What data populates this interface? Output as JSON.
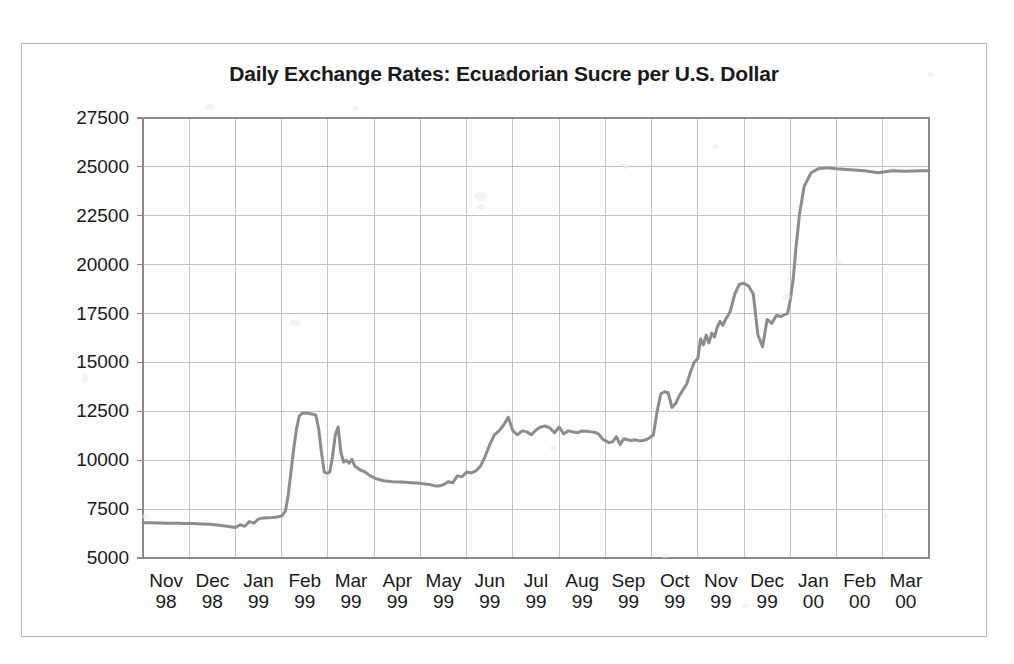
{
  "figure": {
    "title": "Daily Exchange Rates: Ecuadorian Sucre per U.S. Dollar",
    "background_color": "#fefefe",
    "frame_color": "#b9b9b9",
    "grid_color": "#c4c4c4",
    "axis_color": "#8a8a8a",
    "line_color": "#8d8d8d"
  },
  "chart_data": {
    "type": "line",
    "title": "Daily Exchange Rates: Ecuadorian Sucre per U.S. Dollar",
    "xlabel": "",
    "ylabel": "",
    "ylim": [
      5000,
      27500
    ],
    "ytick_values": [
      5000,
      7500,
      10000,
      12500,
      15000,
      17500,
      20000,
      22500,
      25000,
      27500
    ],
    "ytick_labels": [
      "5000",
      "7500",
      "10000",
      "12500",
      "15000",
      "17500",
      "20000",
      "22500",
      "25000",
      "27500"
    ],
    "xtick_labels": [
      {
        "month": "Nov",
        "year": "98"
      },
      {
        "month": "Dec",
        "year": "98"
      },
      {
        "month": "Jan",
        "year": "99"
      },
      {
        "month": "Feb",
        "year": "99"
      },
      {
        "month": "Mar",
        "year": "99"
      },
      {
        "month": "Apr",
        "year": "99"
      },
      {
        "month": "May",
        "year": "99"
      },
      {
        "month": "Jun",
        "year": "99"
      },
      {
        "month": "Jul",
        "year": "99"
      },
      {
        "month": "Aug",
        "year": "99"
      },
      {
        "month": "Sep",
        "year": "99"
      },
      {
        "month": "Oct",
        "year": "99"
      },
      {
        "month": "Nov",
        "year": "99"
      },
      {
        "month": "Dec",
        "year": "99"
      },
      {
        "month": "Jan",
        "year": "00"
      },
      {
        "month": "Feb",
        "year": "00"
      },
      {
        "month": "Mar",
        "year": "00"
      }
    ],
    "grid": true,
    "legend": null,
    "xlim": [
      0,
      17
    ],
    "x_unit": "months since Nov 1 1998",
    "series": [
      {
        "name": "Sucre per U.S. Dollar",
        "color": "#8d8d8d",
        "x": [
          0.0,
          0.18,
          0.36,
          0.55,
          0.73,
          0.91,
          1.09,
          1.27,
          1.45,
          1.64,
          1.82,
          2.0,
          2.1,
          2.2,
          2.3,
          2.4,
          2.5,
          2.6,
          2.7,
          2.8,
          2.9,
          3.0,
          3.08,
          3.14,
          3.2,
          3.26,
          3.32,
          3.38,
          3.44,
          3.5,
          3.56,
          3.62,
          3.68,
          3.74,
          3.8,
          3.86,
          3.92,
          3.98,
          4.04,
          4.1,
          4.16,
          4.22,
          4.28,
          4.34,
          4.4,
          4.46,
          4.52,
          4.58,
          4.64,
          4.7,
          4.8,
          4.92,
          5.05,
          5.2,
          5.4,
          5.6,
          5.8,
          6.0,
          6.1,
          6.2,
          6.3,
          6.4,
          6.5,
          6.6,
          6.7,
          6.8,
          6.9,
          7.0,
          7.1,
          7.2,
          7.3,
          7.4,
          7.5,
          7.6,
          7.7,
          7.8,
          7.9,
          8.0,
          8.1,
          8.2,
          8.3,
          8.4,
          8.5,
          8.6,
          8.7,
          8.8,
          8.9,
          9.0,
          9.1,
          9.2,
          9.3,
          9.4,
          9.5,
          9.6,
          9.7,
          9.8,
          9.85,
          9.9,
          9.95,
          10.0,
          10.08,
          10.16,
          10.24,
          10.32,
          10.4,
          10.48,
          10.56,
          10.64,
          10.72,
          10.8,
          10.88,
          10.96,
          11.04,
          11.12,
          11.2,
          11.28,
          11.36,
          11.44,
          11.52,
          11.6,
          11.68,
          11.76,
          11.84,
          11.92,
          12.0,
          12.06,
          12.12,
          12.18,
          12.24,
          12.3,
          12.36,
          12.42,
          12.48,
          12.54,
          12.6,
          12.7,
          12.8,
          12.9,
          13.0,
          13.1,
          13.2,
          13.3,
          13.4,
          13.5,
          13.6,
          13.7,
          13.8,
          13.88,
          13.94,
          14.0,
          14.06,
          14.12,
          14.2,
          14.3,
          14.45,
          14.6,
          14.8,
          15.0,
          15.3,
          15.6,
          15.9,
          16.2,
          16.5,
          16.8,
          17.0
        ],
        "y": [
          6800,
          6800,
          6790,
          6780,
          6780,
          6770,
          6760,
          6740,
          6720,
          6680,
          6620,
          6560,
          6700,
          6620,
          6860,
          6780,
          7000,
          7050,
          7060,
          7070,
          7100,
          7150,
          7400,
          8200,
          9400,
          10600,
          11600,
          12250,
          12400,
          12420,
          12400,
          12380,
          12350,
          12300,
          11600,
          10400,
          9400,
          9320,
          9400,
          10200,
          11300,
          11700,
          10400,
          9900,
          10000,
          9850,
          10050,
          9700,
          9600,
          9500,
          9400,
          9200,
          9050,
          8950,
          8900,
          8880,
          8850,
          8820,
          8780,
          8760,
          8700,
          8680,
          8750,
          8900,
          8850,
          9200,
          9150,
          9400,
          9350,
          9450,
          9700,
          10200,
          10800,
          11300,
          11500,
          11800,
          12200,
          11500,
          11300,
          11500,
          11450,
          11300,
          11550,
          11700,
          11750,
          11650,
          11400,
          11700,
          11350,
          11500,
          11450,
          11400,
          11500,
          11480,
          11450,
          11400,
          11350,
          11200,
          11050,
          11000,
          10900,
          10950,
          11200,
          10800,
          11100,
          11050,
          11000,
          11050,
          11000,
          11000,
          11050,
          11150,
          11300,
          12500,
          13400,
          13500,
          13450,
          12700,
          12900,
          13300,
          13600,
          13900,
          14500,
          15000,
          15200,
          16200,
          15900,
          16400,
          16000,
          16500,
          16300,
          16800,
          17100,
          16900,
          17200,
          17600,
          18500,
          19000,
          19050,
          18900,
          18500,
          16400,
          15800,
          17200,
          17000,
          17400,
          17350,
          17450,
          17500,
          18200,
          19200,
          20800,
          22600,
          24000,
          24700,
          24900,
          24950,
          24900,
          24850,
          24800,
          24700,
          24800,
          24780,
          24800,
          24800
        ]
      }
    ]
  }
}
